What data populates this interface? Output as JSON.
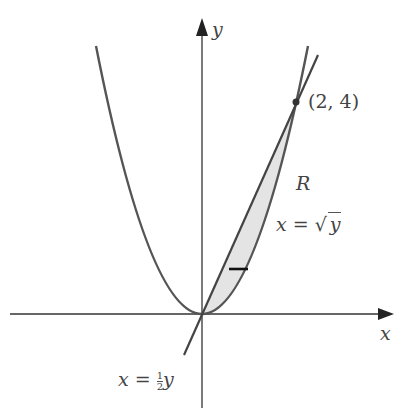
{
  "diagram": {
    "axes": {
      "x_label": "x",
      "y_label": "y"
    },
    "point": {
      "label": "(2, 4)",
      "x": 2,
      "y": 4
    },
    "region_label": "R",
    "curves": [
      {
        "name": "parabola",
        "equation_lhs": "x",
        "equation_eq": "=",
        "equation_rhs": "y",
        "equation_text": "x = √y"
      },
      {
        "name": "line",
        "equation_lhs": "x",
        "equation_eq": "=",
        "frac_num": "1",
        "frac_den": "2",
        "equation_var": "y",
        "equation_text": "x = ½y"
      }
    ],
    "colors": {
      "curve": "#555555",
      "axis": "#333333",
      "shade": "#e6e6e6",
      "strip": "#111111"
    }
  }
}
